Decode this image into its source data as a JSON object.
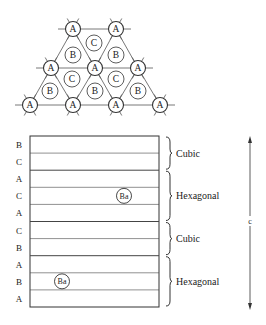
{
  "lattice": {
    "atoms": [
      {
        "label": "A",
        "x": 73,
        "y": 29,
        "bonded": true
      },
      {
        "label": "A",
        "x": 116,
        "y": 29,
        "bonded": true
      },
      {
        "label": "C",
        "x": 94,
        "y": 43,
        "bonded": false
      },
      {
        "label": "B",
        "x": 73,
        "y": 55,
        "bonded": false
      },
      {
        "label": "B",
        "x": 116,
        "y": 55,
        "bonded": false
      },
      {
        "label": "A",
        "x": 51,
        "y": 68,
        "bonded": true
      },
      {
        "label": "A",
        "x": 95,
        "y": 68,
        "bonded": true
      },
      {
        "label": "A",
        "x": 138,
        "y": 68,
        "bonded": true
      },
      {
        "label": "C",
        "x": 72,
        "y": 79,
        "bonded": false
      },
      {
        "label": "C",
        "x": 116,
        "y": 79,
        "bonded": false
      },
      {
        "label": "B",
        "x": 50,
        "y": 91,
        "bonded": false
      },
      {
        "label": "B",
        "x": 95,
        "y": 91,
        "bonded": false
      },
      {
        "label": "B",
        "x": 138,
        "y": 91,
        "bonded": false
      },
      {
        "label": "A",
        "x": 30,
        "y": 105,
        "bonded": true
      },
      {
        "label": "A",
        "x": 73,
        "y": 105,
        "bonded": true
      },
      {
        "label": "A",
        "x": 116,
        "y": 105,
        "bonded": true
      },
      {
        "label": "A",
        "x": 160,
        "y": 105,
        "bonded": true
      }
    ]
  },
  "stacking": {
    "layers": [
      "B",
      "C",
      "A",
      "C",
      "A",
      "C",
      "B",
      "A",
      "B",
      "A"
    ],
    "ba_atoms": [
      {
        "label": "Ba",
        "row": 3
      },
      {
        "label": "Ba",
        "row": 8
      }
    ],
    "sections": [
      {
        "label": "Cubic",
        "from_row": 0,
        "to_row": 1
      },
      {
        "label": "Hexagonal",
        "from_row": 2,
        "to_row": 4
      },
      {
        "label": "Cubic",
        "from_row": 5,
        "to_row": 6
      },
      {
        "label": "Hexagonal",
        "from_row": 7,
        "to_row": 9
      }
    ],
    "axis_label": "c"
  }
}
